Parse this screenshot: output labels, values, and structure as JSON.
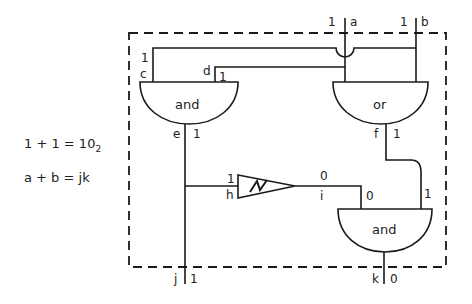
{
  "equations": {
    "line1": {
      "lhs": "1 + 1 = 10",
      "subscript": "2"
    },
    "line2": "a + b = jk"
  },
  "inputs": {
    "a": {
      "name": "a",
      "value": "1"
    },
    "b": {
      "name": "b",
      "value": "1"
    }
  },
  "gates": {
    "and_top": {
      "label": "and"
    },
    "or_top": {
      "label": "or"
    },
    "not": {
      "label": "N"
    },
    "and_bottom": {
      "label": "and"
    }
  },
  "wires": {
    "c": {
      "name": "c",
      "value": "1"
    },
    "d": {
      "name": "d",
      "value": "1"
    },
    "e": {
      "name": "e",
      "value": "1"
    },
    "f": {
      "name": "f",
      "value": "1"
    },
    "h": {
      "name": "h",
      "value": "1"
    },
    "i": {
      "name": "i",
      "value": "0"
    },
    "i_in": {
      "value": "0"
    },
    "f_in": {
      "value": "1"
    }
  },
  "outputs": {
    "j": {
      "name": "j",
      "value": "1"
    },
    "k": {
      "name": "k",
      "value": "0"
    }
  }
}
